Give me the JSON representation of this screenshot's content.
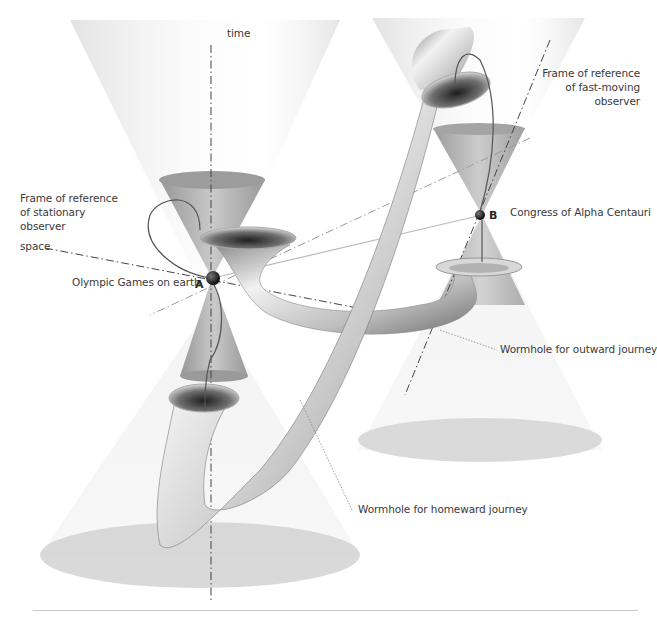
{
  "diagram": {
    "axes": {
      "time": "time",
      "space": "space"
    },
    "frames": {
      "stationary": [
        "Frame of reference",
        "of stationary",
        "observer"
      ],
      "fast_moving": [
        "Frame of reference",
        "of fast-moving",
        "observer"
      ]
    },
    "events": {
      "A": {
        "marker": "A",
        "label": "Olympic Games on earth"
      },
      "B": {
        "marker": "B",
        "label": "Congress of Alpha Centauri"
      }
    },
    "wormholes": {
      "outward": "Wormhole for outward journey",
      "homeward": "Wormhole for homeward journey"
    },
    "colors": {
      "cone_light": "#eeeeee",
      "cone_mid": "#bdbdbd",
      "cone_dark": "#9a9a9a",
      "event_dot": "#111111",
      "line": "#555555",
      "rule": "#c8c8c8"
    }
  }
}
